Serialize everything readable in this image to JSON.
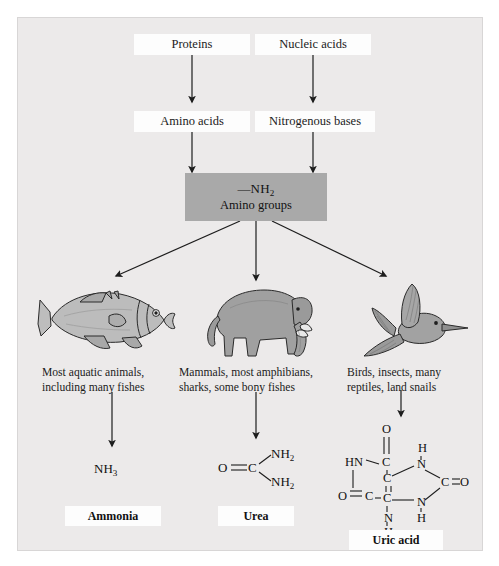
{
  "diagram": {
    "colors": {
      "panel_bg": "#eceaea",
      "box_fill": "#fdfdfd",
      "gray_box": "#a9a9a9",
      "stroke": "#1d1d1d",
      "animal_fill": "#9b9b9b",
      "animal_light": "#c9c9c9"
    },
    "sources": [
      {
        "id": "proteins",
        "label": "Proteins"
      },
      {
        "id": "nucleic-acids",
        "label": "Nucleic acids"
      }
    ],
    "intermediates": [
      {
        "id": "amino-acids",
        "label": "Amino acids"
      },
      {
        "id": "nitrogenous-bases",
        "label": "Nitrogenous bases"
      }
    ],
    "hub": {
      "formula": "—NH",
      "formula_sub": "2",
      "label": "Amino groups"
    },
    "branches": [
      {
        "id": "ammonia",
        "animal": "fish-illustration",
        "caption_line1": "Most aquatic animals,",
        "caption_line2": "including many fishes",
        "molecule": "NH",
        "molecule_sub": "3",
        "product": "Ammonia"
      },
      {
        "id": "urea",
        "animal": "elephant-illustration",
        "caption_line1": "Mammals, most amphibians,",
        "caption_line2": "sharks, some bony fishes",
        "molecule": "O=C(NH2)2",
        "product": "Urea"
      },
      {
        "id": "uric-acid",
        "animal": "hummingbird-illustration",
        "caption_line1": "Birds, insects, many",
        "caption_line2": "reptiles, land snails",
        "molecule": "C5H4N4O3",
        "product": "Uric acid"
      }
    ],
    "urea_atoms": {
      "o": "O",
      "c": "C",
      "n1": "NH",
      "n1_sub": "2",
      "n2": "NH",
      "n2_sub": "2"
    },
    "uric_atoms": {
      "o_top": "O",
      "o_left": "O",
      "o_right": "O",
      "hn_left": "HN",
      "c_top": "C",
      "c_bl": "C",
      "c_center_top": "C",
      "c_center_bottom": "C",
      "n_bottom": "N",
      "h_bottom": "H",
      "n_ur": "N",
      "h_ur": "H",
      "c_right": "C",
      "n_lr": "N",
      "h_lr": "H"
    }
  }
}
